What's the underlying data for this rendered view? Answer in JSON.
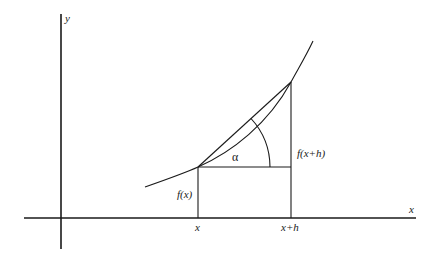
{
  "diagram": {
    "axes": {
      "x_label": "x",
      "y_label": "y"
    },
    "points": {
      "a_x_label": "x",
      "b_x_label": "x+h",
      "a_y_label": "f(x)",
      "b_y_label": "f(x+h)"
    },
    "angle_label": "α",
    "colors": {
      "stroke": "#1a1a1a",
      "background": "#ffffff"
    }
  }
}
